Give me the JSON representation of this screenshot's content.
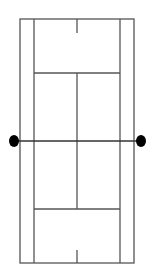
{
  "diagram": {
    "type": "tennis-court",
    "orientation": "vertical",
    "colors": {
      "background": "#ffffff",
      "lines": "#555555",
      "net_posts": "#000000"
    },
    "court": {
      "outer": {
        "x1": 20,
        "y1": 19,
        "x2": 134,
        "y2": 263
      },
      "singles_sidelines_x": [
        34,
        120
      ],
      "service_lines_y": [
        73,
        209
      ],
      "center_service_line_x": 77,
      "net_y": 141,
      "center_marks": [
        {
          "x": 77,
          "y1": 19,
          "y2": 33
        },
        {
          "x": 77,
          "y1": 250,
          "y2": 263
        }
      ]
    },
    "net_posts": [
      {
        "cx": 14,
        "cy": 141,
        "rx": 5,
        "ry": 6
      },
      {
        "cx": 141,
        "cy": 141,
        "rx": 5,
        "ry": 6
      }
    ]
  }
}
